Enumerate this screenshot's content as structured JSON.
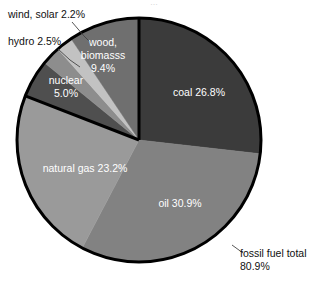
{
  "chart_data": {
    "type": "pie",
    "title": "",
    "subtitle": "",
    "xlabel": "",
    "ylabel": "",
    "legend_position": "none",
    "grid": false,
    "units": "percent",
    "start_angle_deg": 0,
    "direction": "clockwise",
    "categories": [
      "coal",
      "oil",
      "natural gas",
      "nuclear",
      "hydro",
      "wind, solar",
      "wood, biomasss"
    ],
    "values": [
      26.8,
      30.9,
      23.2,
      5.0,
      2.5,
      2.2,
      9.4
    ],
    "slices": [
      {
        "name": "coal",
        "label": "coal 26.8%",
        "value": 26.8,
        "color": "#3b3b3b",
        "label_placement": "inside",
        "label_color": "#ffffff",
        "label_x": 199,
        "label_y": 96
      },
      {
        "name": "oil",
        "label": "oil 30.9%",
        "value": 30.9,
        "color": "#828282",
        "label_placement": "inside",
        "label_color": "#ffffff",
        "label_x": 180,
        "label_y": 207
      },
      {
        "name": "natural gas",
        "label": "natural gas 23.2%",
        "value": 23.2,
        "color": "#9a9a9a",
        "label_placement": "inside",
        "label_color": "#ffffff",
        "label_x": 85,
        "label_y": 172
      },
      {
        "name": "nuclear",
        "label_line_1": "nuclear",
        "label_line_2": "5.0%",
        "value": 5.0,
        "color": "#4f4f4f",
        "label_placement": "inside",
        "label_color": "#ffffff",
        "label_x": 66,
        "label_y": 84
      },
      {
        "name": "hydro",
        "label": "hydro 2.5%",
        "value": 2.5,
        "color": "#8d8d8d",
        "label_placement": "outside",
        "label_color": "#111111",
        "label_x": 8,
        "label_y": 45
      },
      {
        "name": "wind, solar",
        "label": "wind, solar 2.2%",
        "value": 2.2,
        "color": "#c2c2c2",
        "label_placement": "outside",
        "label_color": "#111111",
        "label_x": 8,
        "label_y": 18
      },
      {
        "name": "wood, biomasss",
        "label_line_1": "wood,",
        "label_line_2": "biomasss",
        "label_line_3": "9.4%",
        "value": 9.4,
        "color": "#6f6f6f",
        "label_placement": "inside",
        "label_color": "#ffffff",
        "label_x": 103,
        "label_y": 46
      }
    ],
    "annotations": [
      {
        "name": "fossil-fuel-total",
        "line_1": "fossil fuel total",
        "line_2": "80.9%",
        "value": 80.9,
        "color": "#111111",
        "x": 240,
        "y": 257,
        "points_to": "coal+oil+natural gas"
      }
    ],
    "geometry": {
      "center_x": 139,
      "center_y": 140,
      "radius": 122,
      "outline_color": "#000000",
      "outline_width": 3
    }
  },
  "artifact": {
    "top_fragment": "…"
  }
}
